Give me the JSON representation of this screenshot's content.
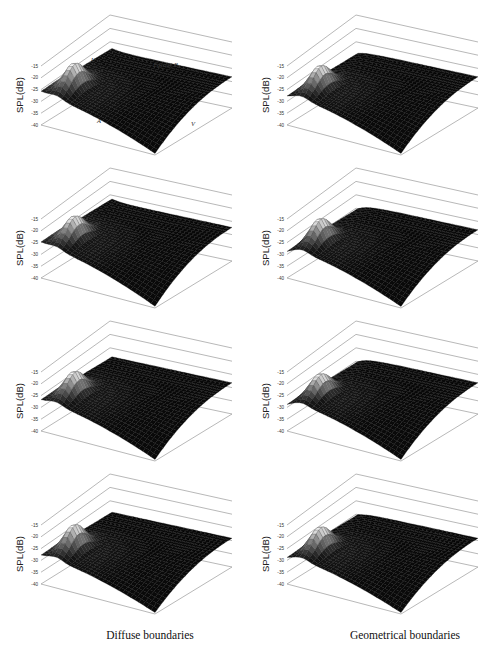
{
  "figure": {
    "captions": {
      "left": "Diffuse boundaries",
      "right": "Geometrical boundaries"
    },
    "ylabel": "SPL(dB)",
    "yticks": [
      "-15",
      "-20",
      "-25",
      "-30",
      "-35",
      "-40"
    ],
    "annotations": {
      "U": "U",
      "facade": "Façade B",
      "A": "A",
      "V": "V"
    }
  },
  "chart_data": [
    {
      "type": "surface",
      "panel": "row1-left",
      "column": "Diffuse boundaries",
      "zlabel": "SPL(dB)",
      "zlim": [
        -40,
        -15
      ],
      "zticks": [
        -15,
        -20,
        -25,
        -30,
        -35,
        -40
      ],
      "peak_spl": -17,
      "edge_spl": -26,
      "plateau_spl": -27,
      "min_spl": -40,
      "annotations": [
        "U",
        "Façade B",
        "A",
        "V"
      ]
    },
    {
      "type": "surface",
      "panel": "row1-right",
      "column": "Geometrical boundaries",
      "zlabel": "SPL(dB)",
      "zlim": [
        -40,
        -15
      ],
      "zticks": [
        -15,
        -20,
        -25,
        -30,
        -35,
        -40
      ],
      "peak_spl": -18,
      "edge_spl": -28,
      "plateau_spl": -27,
      "min_spl": -40
    },
    {
      "type": "surface",
      "panel": "row2-left",
      "column": "Diffuse boundaries",
      "zlabel": "SPL(dB)",
      "zlim": [
        -40,
        -15
      ],
      "zticks": [
        -15,
        -20,
        -25,
        -30,
        -35,
        -40
      ],
      "peak_spl": -17,
      "edge_spl": -25,
      "plateau_spl": -26,
      "min_spl": -40
    },
    {
      "type": "surface",
      "panel": "row2-right",
      "column": "Geometrical boundaries",
      "zlabel": "SPL(dB)",
      "zlim": [
        -40,
        -15
      ],
      "zticks": [
        -15,
        -20,
        -25,
        -30,
        -35,
        -40
      ],
      "peak_spl": -18,
      "edge_spl": -29,
      "plateau_spl": -27,
      "min_spl": -40
    },
    {
      "type": "surface",
      "panel": "row3-left",
      "column": "Diffuse boundaries",
      "zlabel": "SPL(dB)",
      "zlim": [
        -40,
        -15
      ],
      "zticks": [
        -15,
        -20,
        -25,
        -30,
        -35,
        -40
      ],
      "peak_spl": -18,
      "edge_spl": -27,
      "plateau_spl": -27,
      "min_spl": -40
    },
    {
      "type": "surface",
      "panel": "row3-right",
      "column": "Geometrical boundaries",
      "zlabel": "SPL(dB)",
      "zlim": [
        -40,
        -15
      ],
      "zticks": [
        -15,
        -20,
        -25,
        -30,
        -35,
        -40
      ],
      "peak_spl": -19,
      "edge_spl": -29,
      "plateau_spl": -27,
      "min_spl": -40
    },
    {
      "type": "surface",
      "panel": "row4-left",
      "column": "Diffuse boundaries",
      "zlabel": "SPL(dB)",
      "zlim": [
        -40,
        -15
      ],
      "zticks": [
        -15,
        -20,
        -25,
        -30,
        -35,
        -40
      ],
      "peak_spl": -18,
      "edge_spl": -28,
      "plateau_spl": -28,
      "min_spl": -40
    },
    {
      "type": "surface",
      "panel": "row4-right",
      "column": "Geometrical boundaries",
      "zlabel": "SPL(dB)",
      "zlim": [
        -40,
        -15
      ],
      "zticks": [
        -15,
        -20,
        -25,
        -30,
        -35,
        -40
      ],
      "peak_spl": -19,
      "edge_spl": -29,
      "plateau_spl": -28,
      "min_spl": -40
    }
  ],
  "layout": {
    "panels": [
      {
        "id": "row1-left",
        "x": 0,
        "y": 0,
        "annotate": true
      },
      {
        "id": "row1-right",
        "x": 246,
        "y": 0,
        "annotate": false
      },
      {
        "id": "row2-left",
        "x": 0,
        "y": 153,
        "annotate": false
      },
      {
        "id": "row2-right",
        "x": 246,
        "y": 153,
        "annotate": false
      },
      {
        "id": "row3-left",
        "x": 0,
        "y": 306,
        "annotate": false
      },
      {
        "id": "row3-right",
        "x": 246,
        "y": 306,
        "annotate": false
      },
      {
        "id": "row4-left",
        "x": 0,
        "y": 459,
        "annotate": false
      },
      {
        "id": "row4-right",
        "x": 246,
        "y": 459,
        "annotate": false
      }
    ],
    "caption_left_x": 150,
    "caption_right_x": 405
  }
}
